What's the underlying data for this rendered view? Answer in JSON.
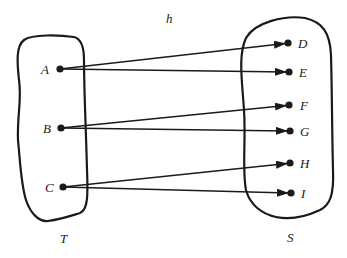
{
  "diagram": {
    "type": "function-mapping",
    "function_label": "h",
    "domain_set": {
      "label": "T",
      "elements": [
        {
          "id": "A",
          "label": "A",
          "x": 60,
          "y": 69
        },
        {
          "id": "B",
          "label": "B",
          "x": 61,
          "y": 128
        },
        {
          "id": "C",
          "label": "C",
          "x": 63,
          "y": 187
        }
      ]
    },
    "codomain_set": {
      "label": "S",
      "elements": [
        {
          "id": "D",
          "label": "D",
          "x": 288,
          "y": 43
        },
        {
          "id": "E",
          "label": "E",
          "x": 289,
          "y": 72
        },
        {
          "id": "F",
          "label": "F",
          "x": 289,
          "y": 105
        },
        {
          "id": "G",
          "label": "G",
          "x": 290,
          "y": 131
        },
        {
          "id": "H",
          "label": "H",
          "x": 290,
          "y": 163
        },
        {
          "id": "I",
          "label": "I",
          "x": 291,
          "y": 193
        }
      ]
    },
    "mappings": [
      {
        "from": "A",
        "to": "D"
      },
      {
        "from": "A",
        "to": "E"
      },
      {
        "from": "B",
        "to": "F"
      },
      {
        "from": "B",
        "to": "G"
      },
      {
        "from": "C",
        "to": "H"
      },
      {
        "from": "C",
        "to": "I"
      }
    ],
    "colors": {
      "ink": "#1a1a1a",
      "background": "#ffffff"
    }
  }
}
